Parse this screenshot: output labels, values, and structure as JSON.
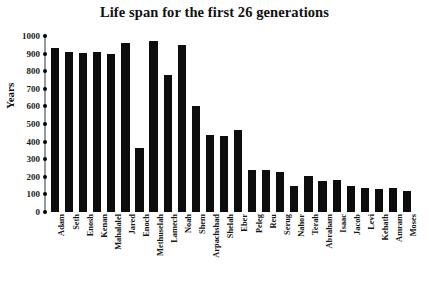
{
  "chart_data": {
    "type": "bar",
    "title": "Life span for the first 26 generations",
    "xlabel": "",
    "ylabel": "Years",
    "ylim": [
      0,
      1000
    ],
    "ytick_step": 100,
    "yticks": [
      1000,
      900,
      800,
      700,
      600,
      500,
      400,
      300,
      200,
      100,
      0
    ],
    "grid": false,
    "legend": null,
    "bar_color": "#0d0d0d",
    "categories": [
      "Adam",
      "Seth",
      "Enosh",
      "Kenan",
      "Mahalalel",
      "Jared",
      "Enoch",
      "Methuselah",
      "Lamech",
      "Noah",
      "Shem",
      "Arpachshad",
      "Shelah",
      "Eber",
      "Peleg",
      "Reu",
      "Serug",
      "Nahor",
      "Terah",
      "Abraham",
      "Isaac",
      "Jacob",
      "Levi",
      "Kehath",
      "Amram",
      "Moses"
    ],
    "values": [
      930,
      912,
      905,
      910,
      895,
      962,
      365,
      969,
      777,
      950,
      600,
      438,
      433,
      464,
      239,
      239,
      230,
      148,
      205,
      175,
      180,
      147,
      137,
      133,
      137,
      120
    ]
  }
}
